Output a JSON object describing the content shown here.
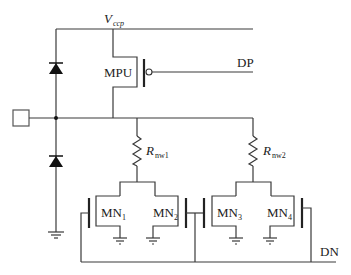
{
  "diagram": {
    "type": "circuit-schematic",
    "labels": {
      "vccp": {
        "main": "V",
        "sub": "ccp"
      },
      "mpu": "MPU",
      "dp": "DP",
      "dn": "DN",
      "rnw1": {
        "main": "R",
        "sub": "nw1"
      },
      "rnw2": {
        "main": "R",
        "sub": "nw2"
      },
      "mn1": {
        "main": "MN",
        "sub": "1"
      },
      "mn2": {
        "main": "MN",
        "sub": "2"
      },
      "mn3": {
        "main": "MN",
        "sub": "3"
      },
      "mn4": {
        "main": "MN",
        "sub": "4"
      }
    },
    "components": [
      {
        "id": "pad",
        "kind": "io-pad"
      },
      {
        "id": "D1",
        "kind": "diode",
        "connects": [
          "pad-node",
          "Vccp"
        ]
      },
      {
        "id": "D2",
        "kind": "diode",
        "connects": [
          "ground",
          "pad-node"
        ]
      },
      {
        "id": "MPU",
        "kind": "pmos",
        "gate": "DP",
        "source": "Vccp",
        "drain": "pad-node"
      },
      {
        "id": "Rnw1",
        "kind": "resistor",
        "connects": [
          "pad-node",
          "MN1/MN2"
        ]
      },
      {
        "id": "Rnw2",
        "kind": "resistor",
        "connects": [
          "pad-node",
          "MN3/MN4"
        ]
      },
      {
        "id": "MN1",
        "kind": "nmos",
        "gate": "DN",
        "source": "ground"
      },
      {
        "id": "MN2",
        "kind": "nmos",
        "gate": "DN",
        "source": "ground"
      },
      {
        "id": "MN3",
        "kind": "nmos",
        "gate": "DN",
        "source": "ground"
      },
      {
        "id": "MN4",
        "kind": "nmos",
        "gate": "DN",
        "source": "ground"
      }
    ]
  }
}
